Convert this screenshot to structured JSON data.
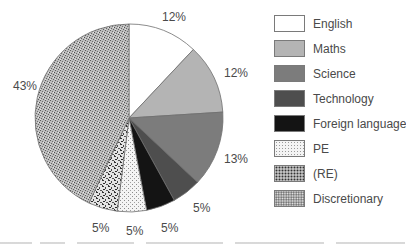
{
  "chart_data": {
    "type": "pie",
    "title": "",
    "start_angle_deg": 0,
    "direction": "clockwise",
    "slices": [
      {
        "label": "English",
        "value": 12,
        "display": "12%",
        "color": "#ffffff",
        "pattern": "solid"
      },
      {
        "label": "Maths",
        "value": 12,
        "display": "12%",
        "color": "#b4b4b4",
        "pattern": "solid"
      },
      {
        "label": "Science",
        "value": 13,
        "display": "13%",
        "color": "#7c7c7c",
        "pattern": "solid"
      },
      {
        "label": "Technology",
        "value": 5,
        "display": "5%",
        "color": "#4e4e4e",
        "pattern": "solid"
      },
      {
        "label": "Foreign language",
        "value": 5,
        "display": "5%",
        "color": "#141414",
        "pattern": "solid"
      },
      {
        "label": "PE",
        "value": 5,
        "display": "5%",
        "color": "#f0f0f0",
        "pattern": "fine-dots"
      },
      {
        "label": "(RE)",
        "value": 5,
        "display": "5%",
        "color": "#c8c8c8",
        "pattern": "coarse-speckle"
      },
      {
        "label": "Discretionary",
        "value": 43,
        "display": "43%",
        "color": "#a8a8a8",
        "pattern": "speckle"
      }
    ],
    "legend": {
      "position": "right",
      "entries": [
        "English",
        "Maths",
        "Science",
        "Technology",
        "Foreign language",
        "PE",
        "(RE)",
        "Discretionary"
      ]
    }
  }
}
